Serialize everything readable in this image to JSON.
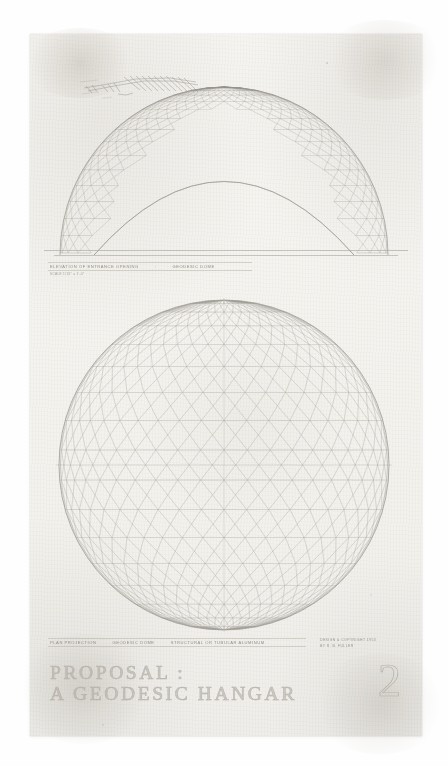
{
  "document": {
    "kind": "architectural-drawing",
    "medium": "pencil on tracing paper",
    "sheet_number": "2",
    "title_line_1": "PROPOSAL :",
    "title_line_2": "A GEODESIC HANGAR"
  },
  "upper_drawing": {
    "name": "elevation-of-entrance-opening",
    "caption_segments": [
      "ELEVATION OF ENTRANCE OPENING",
      ":",
      "GEODESIC DOME"
    ],
    "scale_note": "SCALE  1/16\" = 1'-0\""
  },
  "lower_drawing": {
    "name": "plan-projection-geodesic-dome",
    "caption_segments": [
      "PLAN PROJECTION",
      "GEODESIC DOME",
      "STRUCTURAL OR TUBULAR ALUMINUM"
    ]
  },
  "credit": {
    "line_1": "DESIGN & COPYRIGHT 1953",
    "line_2": "BY R. B. FULLER"
  },
  "annotations": {
    "sketch_mark": "hand-drawn-scrawl"
  },
  "chart_data": {
    "type": "diagram",
    "views": [
      {
        "name": "dome-elevation-with-entrance-opening",
        "projection": "elevation",
        "geometry": "hemispherical geodesic dome",
        "frequency": 16,
        "opening": "large parabolic entrance arch cut through lower half",
        "bounds_px": {
          "cx": 224,
          "cy": 248,
          "rx": 166,
          "ry": 160
        }
      },
      {
        "name": "sphere-plan-projection",
        "projection": "plan / orthographic",
        "geometry": "complete geodesic sphere",
        "frequency": 16,
        "bounds_px": {
          "cx": 224,
          "cy": 465,
          "rx": 165,
          "ry": 165
        }
      }
    ],
    "line_color": "#9a958e",
    "paper_color": "#f4f3ef"
  }
}
